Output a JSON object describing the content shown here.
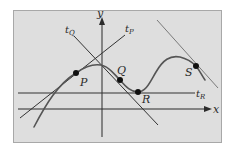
{
  "diagram": {
    "colors": {
      "background": "#ffffff",
      "panel": "#dedede",
      "panel_border": "#a8a8a8",
      "axis": "#2b2b2b",
      "tangent_line": "#333333",
      "curve": "#555555",
      "point": "#111111",
      "s_tangent": "#7a7a7a"
    },
    "axes": {
      "x_label": "x",
      "y_label": "y"
    },
    "points": [
      {
        "name": "P",
        "label": "P"
      },
      {
        "name": "Q",
        "label": "Q"
      },
      {
        "name": "R",
        "label": "R"
      },
      {
        "name": "S",
        "label": "S"
      }
    ],
    "tangents": [
      {
        "name": "tP",
        "base": "t",
        "sub": "P"
      },
      {
        "name": "tQ",
        "base": "t",
        "sub": "Q"
      },
      {
        "name": "tR",
        "base": "t",
        "sub": "R"
      }
    ]
  }
}
